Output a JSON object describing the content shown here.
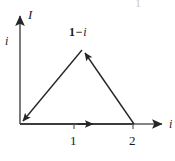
{
  "figure": {
    "kind": "complex-plane-triangle-contour-diagram",
    "background_color": "#ffffff",
    "stroke_color": "#262626",
    "axis_color": "#4a4a4a",
    "width": 175,
    "height": 161,
    "axes": {
      "vertical": {
        "label": "I",
        "secondary_label": "i",
        "arrow": "up",
        "x": 20,
        "top_y": 10,
        "bottom_y": 124
      },
      "horizontal": {
        "label": "i",
        "arrow": "right",
        "y": 124,
        "left_x": 20,
        "right_x": 168
      }
    },
    "ticks": [
      {
        "label": "1",
        "x": 74
      },
      {
        "label": "2",
        "x": 133
      }
    ],
    "vertices": [
      {
        "name": "origin",
        "x": 20,
        "y": 124
      },
      {
        "name": "apex",
        "x": 83,
        "y": 50,
        "label": "1 − i"
      },
      {
        "name": "right-vertex",
        "x": 134,
        "y": 124
      }
    ],
    "apex_label": {
      "one": "1",
      "minus": "−",
      "i": "i"
    },
    "path_arrows": [
      {
        "name": "bottom-edge-arrow",
        "direction": "right",
        "x": 92,
        "y": 124
      },
      {
        "name": "right-edge-arrow",
        "direction": "up-left",
        "x": 83,
        "y": 50
      },
      {
        "name": "left-edge-arrow",
        "direction": "down-left",
        "x": 21,
        "y": 123
      }
    ],
    "stray_mark": "1"
  }
}
